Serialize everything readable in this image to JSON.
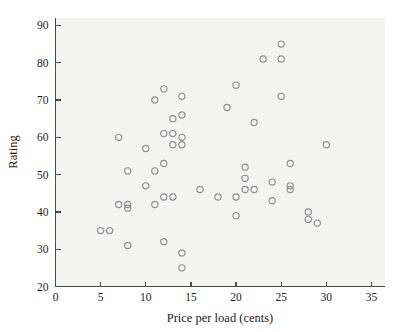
{
  "chart_data": {
    "type": "scatter",
    "title": "",
    "subtitle": "",
    "xlabel": "Price per load (cents)",
    "ylabel": "Rating",
    "xlim": [
      0,
      36.5
    ],
    "ylim": [
      20,
      92
    ],
    "xticks": [
      0,
      5,
      10,
      15,
      20,
      25,
      30,
      35
    ],
    "yticks": [
      20,
      30,
      40,
      50,
      60,
      70,
      80,
      90
    ],
    "xtick_labels": [
      "0",
      "5",
      "10",
      "15",
      "20",
      "25",
      "30",
      "35"
    ],
    "ytick_labels": [
      "20",
      "30",
      "40",
      "50",
      "60",
      "70",
      "80",
      "90"
    ],
    "grid": false,
    "legend": null,
    "marker": "open-circle",
    "marker_color": "#8e8e96",
    "plot_background_color": "#f4f4f2",
    "axis_color": "#4a4a4a",
    "text_color": "#1c1c1c",
    "n_points": 52,
    "x": [
      5,
      6,
      7,
      7,
      8,
      8,
      8,
      8,
      10,
      10,
      11,
      11,
      11,
      12,
      12,
      12,
      12,
      12,
      13,
      13,
      13,
      13,
      14,
      14,
      14,
      14,
      14,
      14,
      16,
      18,
      19,
      20,
      20,
      20,
      21,
      21,
      21,
      22,
      22,
      23,
      24,
      24,
      25,
      25,
      25,
      26,
      26,
      26,
      28,
      28,
      29,
      30
    ],
    "y": [
      35,
      35,
      60,
      42,
      51,
      42,
      41,
      31,
      57,
      47,
      70,
      51,
      42,
      73,
      61,
      53,
      44,
      32,
      65,
      61,
      58,
      44,
      71,
      66,
      60,
      58,
      29,
      25,
      46,
      44,
      68,
      74,
      39,
      44,
      49,
      46,
      52,
      64,
      46,
      81,
      48,
      43,
      85,
      81,
      71,
      53,
      47,
      46,
      40,
      38,
      37,
      58
    ],
    "points": [
      {
        "x": 5,
        "y": 35
      },
      {
        "x": 6,
        "y": 35
      },
      {
        "x": 7,
        "y": 60
      },
      {
        "x": 7,
        "y": 42
      },
      {
        "x": 8,
        "y": 51
      },
      {
        "x": 8,
        "y": 42
      },
      {
        "x": 8,
        "y": 41
      },
      {
        "x": 8,
        "y": 31
      },
      {
        "x": 10,
        "y": 57
      },
      {
        "x": 10,
        "y": 47
      },
      {
        "x": 11,
        "y": 70
      },
      {
        "x": 11,
        "y": 51
      },
      {
        "x": 11,
        "y": 42
      },
      {
        "x": 12,
        "y": 73
      },
      {
        "x": 12,
        "y": 61
      },
      {
        "x": 12,
        "y": 53
      },
      {
        "x": 12,
        "y": 44
      },
      {
        "x": 12,
        "y": 32
      },
      {
        "x": 13,
        "y": 65
      },
      {
        "x": 13,
        "y": 61
      },
      {
        "x": 13,
        "y": 58
      },
      {
        "x": 13,
        "y": 44
      },
      {
        "x": 14,
        "y": 71
      },
      {
        "x": 14,
        "y": 66
      },
      {
        "x": 14,
        "y": 60
      },
      {
        "x": 14,
        "y": 58
      },
      {
        "x": 14,
        "y": 29
      },
      {
        "x": 14,
        "y": 25
      },
      {
        "x": 16,
        "y": 46
      },
      {
        "x": 18,
        "y": 44
      },
      {
        "x": 19,
        "y": 68
      },
      {
        "x": 20,
        "y": 74
      },
      {
        "x": 20,
        "y": 39
      },
      {
        "x": 20,
        "y": 44
      },
      {
        "x": 21,
        "y": 49
      },
      {
        "x": 21,
        "y": 46
      },
      {
        "x": 21,
        "y": 52
      },
      {
        "x": 22,
        "y": 64
      },
      {
        "x": 22,
        "y": 46
      },
      {
        "x": 23,
        "y": 81
      },
      {
        "x": 24,
        "y": 48
      },
      {
        "x": 24,
        "y": 43
      },
      {
        "x": 25,
        "y": 85
      },
      {
        "x": 25,
        "y": 81
      },
      {
        "x": 25,
        "y": 71
      },
      {
        "x": 26,
        "y": 53
      },
      {
        "x": 26,
        "y": 47
      },
      {
        "x": 26,
        "y": 46
      },
      {
        "x": 28,
        "y": 40
      },
      {
        "x": 28,
        "y": 38
      },
      {
        "x": 29,
        "y": 37
      },
      {
        "x": 30,
        "y": 58
      }
    ]
  }
}
